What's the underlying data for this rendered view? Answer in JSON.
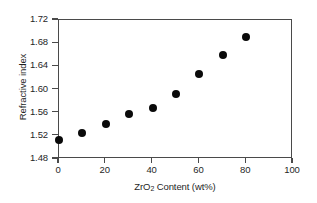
{
  "chart_data": {
    "type": "scatter",
    "title": "",
    "xlabel": "ZrO2 Content (wt%)",
    "xlabel_prefix": "ZrO",
    "xlabel_sub": "2",
    "xlabel_suffix": " Content (wt%)",
    "ylabel": "Refractive index",
    "xlim": [
      0,
      100
    ],
    "ylim": [
      1.48,
      1.72
    ],
    "xticks": [
      0,
      20,
      40,
      60,
      80,
      100
    ],
    "xtick_labels": [
      "0",
      "20",
      "40",
      "60",
      "80",
      "100"
    ],
    "yticks": [
      1.48,
      1.52,
      1.56,
      1.6,
      1.64,
      1.68,
      1.72
    ],
    "ytick_labels": [
      "1.48",
      "1.52",
      "1.56",
      "1.60",
      "1.64",
      "1.68",
      "1.72"
    ],
    "grid": false,
    "legend": null,
    "marker": "filled-circle",
    "marker_color": "#0a0a0a",
    "frame_color": "#4a4a4a",
    "background": "#ffffff",
    "series": [
      {
        "name": "Refractive index",
        "x": [
          0,
          10,
          20,
          30,
          40,
          50,
          60,
          70,
          80
        ],
        "values": [
          1.512,
          1.525,
          1.54,
          1.558,
          1.568,
          1.593,
          1.626,
          1.66,
          1.691
        ]
      }
    ]
  }
}
